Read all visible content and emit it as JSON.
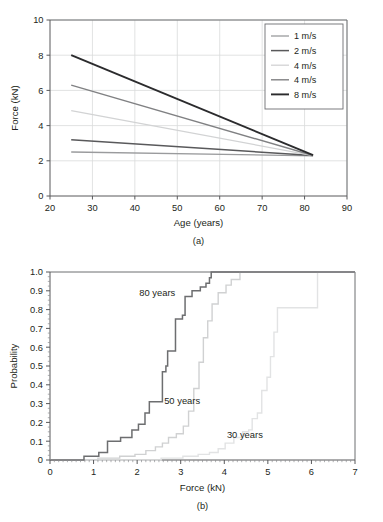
{
  "figure": {
    "panels": [
      {
        "id": "a",
        "caption": "(a)"
      },
      {
        "id": "b",
        "caption": "(b)"
      }
    ]
  },
  "chart_data": [
    {
      "type": "line",
      "panel": "(a)",
      "title": "",
      "xlabel": "Age (years)",
      "ylabel": "Force (kN)",
      "xlim": [
        20,
        90
      ],
      "ylim": [
        0,
        10
      ],
      "xticks": [
        20,
        30,
        40,
        50,
        60,
        70,
        80,
        90
      ],
      "yticks": [
        0,
        2,
        4,
        6,
        8,
        10
      ],
      "xtick_labels": [
        "20",
        "30",
        "40",
        "50",
        "60",
        "70",
        "80",
        "90"
      ],
      "ytick_labels": [
        "0",
        "2",
        "4",
        "6",
        "8",
        "10"
      ],
      "grid": true,
      "legend_position": "top-right",
      "series": [
        {
          "name": "1 m/s",
          "color": "#9a9b9d",
          "width": 1.3,
          "x": [
            25,
            82
          ],
          "values": [
            2.5,
            2.28
          ]
        },
        {
          "name": "2 m/s",
          "color": "#59595b",
          "width": 1.5,
          "x": [
            25,
            82
          ],
          "values": [
            3.2,
            2.3
          ]
        },
        {
          "name": "4 m/s",
          "color": "#d2d3d4",
          "width": 1.3,
          "x": [
            25,
            82
          ],
          "values": [
            4.85,
            2.3
          ]
        },
        {
          "name": "4 m/s",
          "color": "#808183",
          "width": 1.4,
          "x": [
            25,
            82
          ],
          "values": [
            6.3,
            2.3
          ]
        },
        {
          "name": "8 m/s",
          "color": "#2b2b2d",
          "width": 1.9,
          "x": [
            25,
            82
          ],
          "values": [
            8.0,
            2.32
          ]
        }
      ]
    },
    {
      "type": "line",
      "subtype": "step-cdf",
      "panel": "(b)",
      "title": "",
      "xlabel": "Force (kN)",
      "ylabel": "Probability",
      "xlim": [
        0,
        7
      ],
      "ylim": [
        0,
        1.0
      ],
      "xticks": [
        0,
        1,
        2,
        3,
        4,
        5,
        6,
        7
      ],
      "yticks": [
        0,
        0.1,
        0.2,
        0.3,
        0.4,
        0.5,
        0.6,
        0.7,
        0.8,
        0.9,
        1.0
      ],
      "xtick_labels": [
        "0",
        "1",
        "2",
        "3",
        "4",
        "5",
        "6",
        "7"
      ],
      "ytick_labels": [
        "0",
        "0.1",
        "0.2",
        "0.3",
        "0.4",
        "0.5",
        "0.6",
        "0.7",
        "0.8",
        "0.9",
        "1.0"
      ],
      "grid": false,
      "minor_ticks": true,
      "annotations": [
        {
          "text": "80 years",
          "x": 2.05,
          "y": 0.875
        },
        {
          "text": "50 years",
          "x": 2.62,
          "y": 0.3
        },
        {
          "text": "30 years",
          "x": 4.06,
          "y": 0.115
        }
      ],
      "series": [
        {
          "name": "80 years",
          "color": "#6d6e70",
          "width": 1.5,
          "x": [
            0.0,
            0.78,
            0.78,
            1.12,
            1.12,
            1.32,
            1.32,
            1.62,
            1.62,
            1.88,
            1.88,
            2.03,
            2.03,
            2.18,
            2.18,
            2.28,
            2.28,
            2.58,
            2.58,
            2.66,
            2.66,
            2.7,
            2.7,
            2.88,
            2.88,
            3.04,
            3.04,
            3.1,
            3.1,
            3.26,
            3.26,
            3.45,
            3.45,
            3.58,
            3.58,
            3.66,
            3.66,
            3.7,
            3.7,
            7.0
          ],
          "values": [
            0.0,
            0.0,
            0.02,
            0.02,
            0.04,
            0.04,
            0.1,
            0.1,
            0.12,
            0.12,
            0.16,
            0.16,
            0.19,
            0.19,
            0.25,
            0.25,
            0.31,
            0.31,
            0.47,
            0.47,
            0.5,
            0.5,
            0.58,
            0.58,
            0.75,
            0.75,
            0.77,
            0.77,
            0.87,
            0.87,
            0.9,
            0.9,
            0.92,
            0.92,
            0.94,
            0.94,
            0.97,
            0.97,
            1.0,
            1.0
          ]
        },
        {
          "name": "50 years",
          "color": "#d0d1d2",
          "width": 1.4,
          "x": [
            0.0,
            1.1,
            1.1,
            1.6,
            1.6,
            1.95,
            1.95,
            2.2,
            2.2,
            2.42,
            2.42,
            2.58,
            2.58,
            2.72,
            2.72,
            2.9,
            2.9,
            3.06,
            3.06,
            3.18,
            3.18,
            3.3,
            3.3,
            3.42,
            3.42,
            3.52,
            3.52,
            3.62,
            3.62,
            3.72,
            3.72,
            3.86,
            3.86,
            4.04,
            4.04,
            4.16,
            4.16,
            4.36,
            4.36,
            7.0
          ],
          "values": [
            0.0,
            0.0,
            0.01,
            0.01,
            0.02,
            0.02,
            0.03,
            0.03,
            0.05,
            0.05,
            0.07,
            0.07,
            0.09,
            0.09,
            0.12,
            0.12,
            0.14,
            0.14,
            0.18,
            0.18,
            0.26,
            0.26,
            0.38,
            0.38,
            0.52,
            0.52,
            0.65,
            0.65,
            0.74,
            0.74,
            0.83,
            0.83,
            0.89,
            0.89,
            0.93,
            0.93,
            0.96,
            0.96,
            1.0,
            1.0
          ]
        },
        {
          "name": "30 years",
          "color": "#e2e3e4",
          "width": 1.4,
          "x": [
            0.0,
            2.55,
            2.55,
            3.05,
            3.05,
            3.4,
            3.4,
            3.66,
            3.66,
            3.86,
            3.86,
            4.02,
            4.02,
            4.22,
            4.22,
            4.42,
            4.42,
            4.56,
            4.56,
            4.64,
            4.64,
            4.76,
            4.76,
            4.86,
            4.86,
            4.98,
            4.98,
            5.06,
            5.06,
            5.14,
            5.14,
            5.22,
            5.22,
            6.14,
            6.14,
            7.0
          ],
          "values": [
            0.0,
            0.0,
            0.01,
            0.01,
            0.02,
            0.02,
            0.03,
            0.03,
            0.04,
            0.04,
            0.06,
            0.06,
            0.09,
            0.09,
            0.12,
            0.12,
            0.15,
            0.15,
            0.16,
            0.16,
            0.22,
            0.22,
            0.25,
            0.25,
            0.37,
            0.37,
            0.44,
            0.44,
            0.55,
            0.55,
            0.68,
            0.68,
            0.81,
            0.81,
            1.0,
            1.0
          ]
        }
      ]
    }
  ]
}
